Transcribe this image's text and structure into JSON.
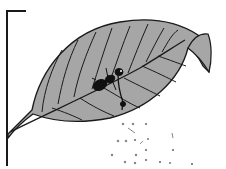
{
  "figure": {
    "colors": {
      "background": "#ffffff",
      "leaf_fill": "#a6a6a6",
      "outline": "#1a1a1a",
      "insect": "#111111",
      "particles": "#777777"
    },
    "elements": [
      "stand-bracket",
      "leaf",
      "midrib",
      "veins",
      "insect",
      "falling-particles"
    ]
  }
}
